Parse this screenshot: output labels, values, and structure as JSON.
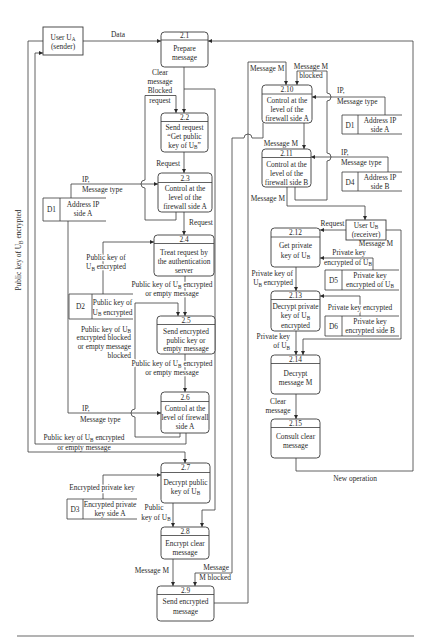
{
  "figure": {
    "external_entities": {
      "user_a": {
        "name": {
          "t": "User U",
          "s": "A",
          "e": ""
        },
        "role": "(sender)"
      },
      "user_b": {
        "name": {
          "t": "User U",
          "s": "B",
          "e": ""
        },
        "role": "(receiver)"
      }
    },
    "processes": {
      "p2_1": {
        "num": "2.1",
        "l1": "Prepare",
        "l2": "message"
      },
      "p2_2": {
        "num": "2.2",
        "l1": "Send request",
        "l2": "“Get public",
        "l3": {
          "t": "key of U",
          "s": "B",
          "e": "”"
        }
      },
      "p2_3": {
        "num": "2.3",
        "l1": "Control at the",
        "l2": "level of the",
        "l3": "firewall side A"
      },
      "p2_4": {
        "num": "2.4",
        "l1": "Treat request by",
        "l2": "the authentication",
        "l3": "server"
      },
      "p2_5": {
        "num": "2.5",
        "l1": "Send encrypted",
        "l2": "public key or",
        "l3": "empty message"
      },
      "p2_6": {
        "num": "2.6",
        "l1": "Control at the",
        "l2": "level of firewall",
        "l3": "side A"
      },
      "p2_7": {
        "num": "2.7",
        "l1": "Decrypt public",
        "l2": {
          "t": "key of U",
          "s": "B",
          "e": ""
        }
      },
      "p2_8": {
        "num": "2.8",
        "l1": "Encrypt clear",
        "l2": "message"
      },
      "p2_9": {
        "num": "2.9",
        "l1": "Send encrypted",
        "l2": "message"
      },
      "p2_10": {
        "num": "2.10",
        "l1": "Control at the",
        "l2": "level of the",
        "l3": "firewall side A"
      },
      "p2_11": {
        "num": "2.11",
        "l1": "Control at the",
        "l2": "level of the",
        "l3": "firewall side B"
      },
      "p2_12": {
        "num": "2.12",
        "l1": "Get private",
        "l2": {
          "t": "key of U",
          "s": "B",
          "e": ""
        }
      },
      "p2_13": {
        "num": "2.13",
        "l1": "Decrypt private",
        "l2": {
          "t": "key of U",
          "s": "B",
          "e": ""
        },
        "l3": "encrypted"
      },
      "p2_14": {
        "num": "2.14",
        "l1": "Decrypt",
        "l2": "message M"
      },
      "p2_15": {
        "num": "2.15",
        "l1": "Consult clear",
        "l2": "message"
      }
    },
    "data_stores": {
      "d1_left": {
        "id": "D1",
        "l1": "Address IP",
        "l2": "side A"
      },
      "d2": {
        "id": "D2",
        "l1": "Public key of",
        "l2": {
          "t": "U",
          "s": "B",
          "e": " encrypted"
        }
      },
      "d3": {
        "id": "D3",
        "l1": "Encrypted private",
        "l2": "key side A"
      },
      "d1_right": {
        "id": "D1",
        "l1": "Address IP",
        "l2": "side A"
      },
      "d4": {
        "id": "D4",
        "l1": "Address IP",
        "l2": "side B"
      },
      "d5": {
        "id": "D5",
        "l1": "Private key",
        "l2": {
          "t": "encrypted of U",
          "s": "B",
          "e": ""
        }
      },
      "d6": {
        "id": "D6",
        "l1": "Private key",
        "l2": "encrypted side B"
      }
    },
    "flows": {
      "data": "Data",
      "clear_or_blocked_to_2_2": [
        "Clear",
        "message",
        "Blocked",
        "request"
      ],
      "request_2_2_to_2_3": "Request",
      "ip_d1_to_2_3": [
        "IP,",
        "Message type"
      ],
      "request_2_3_to_2_4": "Request",
      "pubkey_d2_to_2_4": [
        "Public key of",
        {
          "t": "U",
          "s": "B",
          "e": " encrypted"
        }
      ],
      "pubkey_2_4_to_2_5": [
        {
          "t": "Public key of U",
          "s": "B",
          "e": " encrypted"
        },
        "or empty message"
      ],
      "pubkey_blocked_to_2_5": [
        {
          "t": "Public key of U",
          "s": "B",
          "e": ""
        },
        "encrypted blocked",
        "or empty message",
        "blocked"
      ],
      "pubkey_2_5_to_2_6": [
        {
          "t": "Public key of U",
          "s": "B",
          "e": " encrypted"
        },
        "or empty message"
      ],
      "ip_d1_to_2_6": [
        "IP,",
        "Message type"
      ],
      "pubkey_2_6_to_user_a": [
        {
          "t": "Public key of  U",
          "s": "B",
          "e": " encrypted"
        },
        "or empty message"
      ],
      "pubkey_to_user_a_vertical": {
        "t": "Public key of  U",
        "s": "B",
        "e": " encrypted"
      },
      "encrypted_private_key_d3_to_2_7": "Encrypted private key",
      "pubkey_2_7_to_2_8": [
        "Public",
        {
          "t": "key of U",
          "s": "B",
          "e": ""
        }
      ],
      "message_m_2_8_to_2_9": "Message M",
      "message_m_blocked_to_2_9": [
        "Message",
        "M blocked"
      ],
      "message_m_to_2_10": "Message M",
      "message_m_blocked_to_2_10": [
        "Message M",
        "blocked"
      ],
      "ip_d1_to_2_10": [
        "IP,",
        "Message type"
      ],
      "message_m_2_10_to_2_11": "Message M",
      "ip_d4_to_2_11": [
        "IP,",
        "Message type"
      ],
      "message_m_2_11_to_user_b": "Message M",
      "request_user_b_to_2_12": "Request",
      "message_m_user_b_to_2_14": "Message M",
      "privkey_d5_to_2_12": [
        "Private key",
        {
          "t": "encrypted of U",
          "s": "B",
          "e": ""
        }
      ],
      "privkey_2_12_to_2_13": [
        "Private key of",
        {
          "t": "U",
          "s": "B",
          "e": " encrypted"
        }
      ],
      "privkey_d6_to_2_13": "Private key encrypted",
      "privkey_2_13_to_2_14": [
        "Private key",
        {
          "t": "of U",
          "s": "B",
          "e": ""
        }
      ],
      "clear_message_2_14_to_2_15": [
        "Clear",
        "message"
      ],
      "new_operation_2_15_to_2_1": "New operation"
    }
  }
}
